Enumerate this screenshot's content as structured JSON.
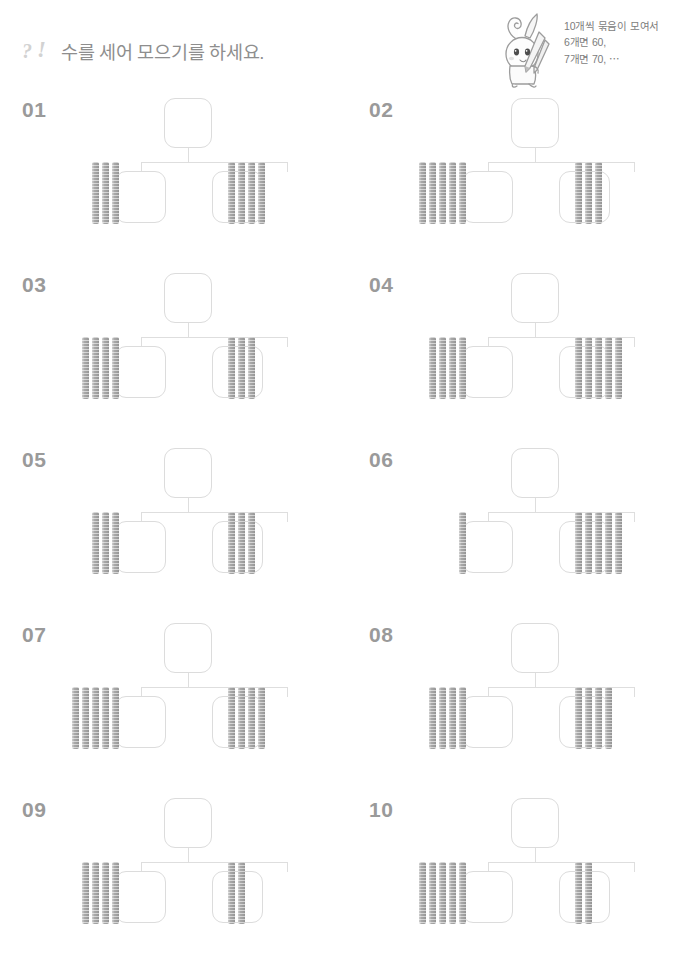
{
  "header": {
    "icon_name": "question-exclamation-icon",
    "icon_q": "?",
    "icon_x": "!",
    "title": "수를 세어 모으기를 하세요."
  },
  "mascot": {
    "name": "rabbit-mascot",
    "speech_lines": [
      "10개씩 묶음이 모여서",
      "6개면 60,",
      "7개면 70, ⋯"
    ]
  },
  "problems": [
    {
      "number": "01",
      "left_bundles": 3,
      "right_bundles": 4,
      "parent_value": "",
      "left_value": "",
      "right_value": ""
    },
    {
      "number": "02",
      "left_bundles": 5,
      "right_bundles": 3,
      "parent_value": "",
      "left_value": "",
      "right_value": ""
    },
    {
      "number": "03",
      "left_bundles": 4,
      "right_bundles": 3,
      "parent_value": "",
      "left_value": "",
      "right_value": ""
    },
    {
      "number": "04",
      "left_bundles": 4,
      "right_bundles": 5,
      "parent_value": "",
      "left_value": "",
      "right_value": ""
    },
    {
      "number": "05",
      "left_bundles": 3,
      "right_bundles": 3,
      "parent_value": "",
      "left_value": "",
      "right_value": ""
    },
    {
      "number": "06",
      "left_bundles": 1,
      "right_bundles": 5,
      "parent_value": "",
      "left_value": "",
      "right_value": ""
    },
    {
      "number": "07",
      "left_bundles": 5,
      "right_bundles": 4,
      "parent_value": "",
      "left_value": "",
      "right_value": ""
    },
    {
      "number": "08",
      "left_bundles": 4,
      "right_bundles": 4,
      "parent_value": "",
      "left_value": "",
      "right_value": ""
    },
    {
      "number": "09",
      "left_bundles": 4,
      "right_bundles": 2,
      "parent_value": "",
      "left_value": "",
      "right_value": ""
    },
    {
      "number": "10",
      "left_bundles": 5,
      "right_bundles": 2,
      "parent_value": "",
      "left_value": "",
      "right_value": ""
    }
  ],
  "colors": {
    "page_bg": "#ffffff",
    "title_text": "#8e8e8e",
    "problem_number": "#9a9a9a",
    "box_border": "#dcdcdc",
    "connector_line": "#dedede",
    "bundle_fill": "#a8a8a8",
    "speech_text": "#7c7c7c"
  }
}
